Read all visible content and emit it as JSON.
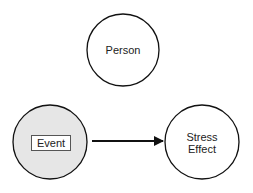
{
  "diagram": {
    "nodes": [
      {
        "id": "person",
        "label": "Person",
        "fill": "#ffffff"
      },
      {
        "id": "event",
        "label": "Event",
        "fill": "#e6e6e6"
      },
      {
        "id": "stress",
        "label_line1": "Stress",
        "label_line2": "Effect",
        "fill": "#ffffff"
      }
    ],
    "edges": [
      {
        "from": "event",
        "to": "stress",
        "type": "arrow"
      }
    ]
  }
}
